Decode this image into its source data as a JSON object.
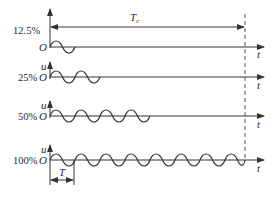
{
  "diagram": {
    "colors": {
      "ink": "#333333",
      "background": "#ffffff"
    },
    "control_period_label": "T",
    "control_period_subscript": "c",
    "period_label": "T",
    "time_axis_label": "t",
    "voltage_axis_label": "u",
    "origin_label": "O",
    "rows": [
      {
        "percent": "12.5%",
        "periods": 1,
        "show_u_label": false
      },
      {
        "percent": "25%",
        "periods": 2,
        "show_u_label": true
      },
      {
        "percent": "50%",
        "periods": 4,
        "show_u_label": true
      },
      {
        "percent": "100%",
        "periods": 8,
        "show_u_label": true
      }
    ]
  }
}
